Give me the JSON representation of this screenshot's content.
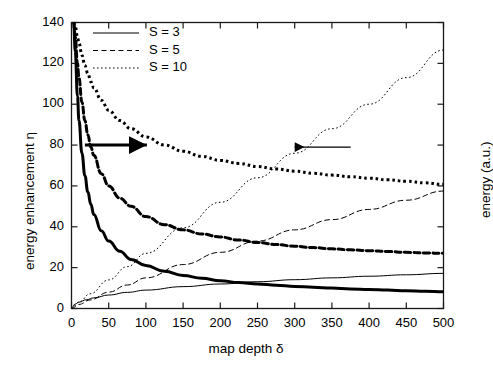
{
  "chart_data": {
    "type": "line",
    "title": "",
    "xlabel": "map depth δ",
    "ylabel_left": "energy enhancement η",
    "ylabel_right": "energy (a.u.)",
    "xlim": [
      0,
      500
    ],
    "ylim_left": [
      0,
      140
    ],
    "ylim_right": [
      0,
      140
    ],
    "xticks": [
      0,
      50,
      100,
      150,
      200,
      250,
      300,
      350,
      400,
      450,
      500
    ],
    "xticklabels": [
      "0",
      "50",
      "100",
      "150",
      "200",
      "250",
      "300",
      "350",
      "400",
      "450",
      "500"
    ],
    "yticks_left": [
      0,
      20,
      40,
      60,
      80,
      100,
      120,
      140
    ],
    "yticklabels_left": [
      "0",
      "20",
      "40",
      "60",
      "80",
      "100",
      "120",
      "140"
    ],
    "yticks_right": [
      0,
      20,
      40,
      60,
      80,
      100,
      120,
      140
    ],
    "yticklabels_right": [
      "",
      "",
      "",
      "",
      "",
      "",
      "",
      ""
    ],
    "grid": false,
    "legend_position": "top-left",
    "legend": [
      {
        "label": "S = 3",
        "style": "solid"
      },
      {
        "label": "S = 5",
        "style": "dashed"
      },
      {
        "label": "S = 10",
        "style": "dotted"
      }
    ],
    "annotations": [
      {
        "name": "left-axis-arrow",
        "text": "",
        "direction": "right",
        "x": 18,
        "y": 80
      },
      {
        "name": "right-axis-arrow",
        "text": "",
        "direction": "left",
        "x": 300,
        "y": 79
      }
    ],
    "series": [
      {
        "name": "enhancement S = 3",
        "axis": "left",
        "style": "solid",
        "width": "thick",
        "x": [
          3,
          5,
          8,
          10,
          14,
          18,
          22,
          26,
          30,
          40,
          50,
          65,
          80,
          100,
          125,
          150,
          175,
          200,
          225,
          250,
          275,
          300,
          325,
          350,
          375,
          400,
          425,
          450,
          475,
          500
        ],
        "y": [
          140,
          126,
          104,
          92,
          76,
          65,
          57,
          51,
          46,
          38,
          33,
          28,
          24,
          21,
          18.2,
          16.2,
          14.8,
          13.6,
          12.7,
          12.0,
          11.4,
          10.8,
          10.4,
          10.0,
          9.6,
          9.3,
          9.0,
          8.7,
          8.4,
          8.2
        ]
      },
      {
        "name": "enhancement S = 5",
        "axis": "left",
        "style": "dashed",
        "width": "thick",
        "x": [
          3,
          5,
          8,
          10,
          14,
          18,
          22,
          26,
          30,
          40,
          50,
          65,
          80,
          100,
          125,
          150,
          175,
          200,
          225,
          250,
          275,
          300,
          325,
          350,
          375,
          400,
          425,
          450,
          475,
          500
        ],
        "y": [
          140,
          133,
          120,
          113,
          101,
          92,
          85,
          79,
          75,
          66,
          60,
          54,
          50,
          45,
          41,
          38.5,
          36.5,
          35,
          33.5,
          32.3,
          31.3,
          30.5,
          29.8,
          29.2,
          28.7,
          28.3,
          27.9,
          27.5,
          27.2,
          27.0
        ]
      },
      {
        "name": "enhancement S = 10",
        "axis": "left",
        "style": "dotted",
        "width": "thick",
        "x": [
          3,
          5,
          8,
          10,
          14,
          18,
          22,
          26,
          30,
          40,
          50,
          65,
          80,
          100,
          125,
          150,
          175,
          200,
          225,
          250,
          275,
          300,
          325,
          350,
          375,
          400,
          425,
          450,
          475,
          500
        ],
        "y": [
          140,
          138,
          133,
          130,
          124,
          119,
          115,
          111,
          108,
          102,
          97,
          92,
          88,
          84,
          80,
          77,
          74.5,
          72.5,
          71,
          69.5,
          68.3,
          67.2,
          66.2,
          65.3,
          64.5,
          63.8,
          63.0,
          62.3,
          61.5,
          60.8
        ]
      },
      {
        "name": "energy S = 3",
        "axis": "right",
        "style": "solid",
        "width": "thin",
        "x": [
          0,
          5,
          10,
          20,
          30,
          50,
          75,
          100,
          150,
          200,
          250,
          300,
          350,
          400,
          450,
          500
        ],
        "y": [
          0,
          2.2,
          3.1,
          4.3,
          5.2,
          6.6,
          7.9,
          9.0,
          10.7,
          12.0,
          13.1,
          14.1,
          15.0,
          15.8,
          16.5,
          17.2
        ]
      },
      {
        "name": "energy S = 5",
        "axis": "right",
        "style": "dashed",
        "width": "thin",
        "x": [
          0,
          10,
          25,
          50,
          75,
          100,
          150,
          200,
          250,
          300,
          350,
          400,
          450,
          500
        ],
        "y": [
          0,
          2.0,
          4.2,
          8.0,
          11.5,
          15.0,
          21.5,
          27.5,
          33.0,
          38.5,
          43.5,
          48.5,
          53.0,
          57.5
        ]
      },
      {
        "name": "energy S = 10",
        "axis": "right",
        "style": "dotted",
        "width": "thin",
        "x": [
          0,
          10,
          25,
          50,
          75,
          100,
          150,
          200,
          250,
          300,
          350,
          400,
          450,
          500
        ],
        "y": [
          0,
          3.2,
          7.2,
          14.0,
          20.5,
          27.0,
          39.5,
          52.0,
          64.0,
          76.0,
          88.0,
          100.0,
          113.0,
          126.5
        ]
      }
    ]
  },
  "colors": {
    "line": "#000000",
    "axis": "#1a1a1a",
    "background": "#ffffff"
  }
}
